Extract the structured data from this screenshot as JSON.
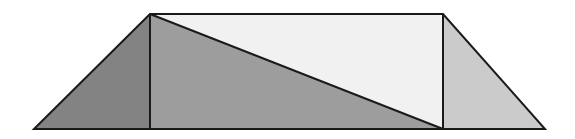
{
  "figure": {
    "canvas": {
      "width": 575,
      "height": 139,
      "background_color": "#ffffff"
    },
    "outline": {
      "name": "trapezoid-outline",
      "points": "34,129 150,14 443,14 545,129",
      "stroke_color": "#1a1a1a",
      "stroke_width": 2.0
    },
    "vertices": {
      "bottom_left": {
        "x": 34,
        "y": 129
      },
      "top_left": {
        "x": 150,
        "y": 14
      },
      "top_right": {
        "x": 443,
        "y": 14
      },
      "bottom_right": {
        "x": 545,
        "y": 129
      },
      "base_left_inner": {
        "x": 150,
        "y": 129
      },
      "base_right_inner": {
        "x": 443,
        "y": 129
      }
    },
    "regions": [
      {
        "id": "left-triangle",
        "label": "Left triangle",
        "points": "34,129 150,14 150,129",
        "fill_color": "#838383",
        "shade": "dark gray"
      },
      {
        "id": "lower-middle-triangle",
        "label": "Lower middle triangle",
        "points": "150,14 443,129 150,129",
        "fill_color": "#9d9d9d",
        "shade": "medium gray"
      },
      {
        "id": "upper-middle-triangle",
        "label": "Upper middle triangle",
        "points": "150,14 443,14 443,129",
        "fill_color": "#f1f1f1",
        "shade": "very light gray"
      },
      {
        "id": "right-triangle",
        "label": "Right triangle",
        "points": "443,14 545,129 443,129",
        "fill_color": "#cbcbcb",
        "shade": "light gray"
      }
    ],
    "internal_lines": [
      {
        "id": "left-vertical-line",
        "label": "Left vertical divider",
        "x1": 150,
        "y1": 14,
        "x2": 150,
        "y2": 129,
        "stroke_color": "#1a1a1a",
        "stroke_width": 2.0
      },
      {
        "id": "right-vertical-line",
        "label": "Right vertical divider",
        "x1": 443,
        "y1": 14,
        "x2": 443,
        "y2": 129,
        "stroke_color": "#1a1a1a",
        "stroke_width": 2.0
      },
      {
        "id": "diagonal-line",
        "label": "Diagonal divider",
        "x1": 150,
        "y1": 14,
        "x2": 443,
        "y2": 129,
        "stroke_color": "#1a1a1a",
        "stroke_width": 2.0
      },
      {
        "id": "base-line",
        "label": "Baseline",
        "x1": 34,
        "y1": 129,
        "x2": 545,
        "y2": 129,
        "stroke_color": "#1a1a1a",
        "stroke_width": 2.0
      }
    ]
  }
}
